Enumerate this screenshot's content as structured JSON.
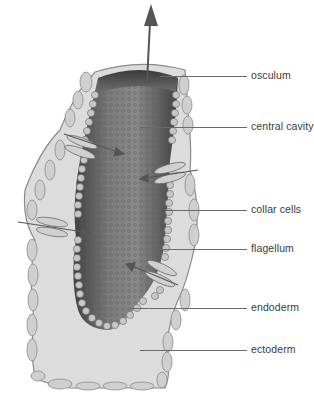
{
  "diagram": {
    "colors": {
      "background": "#ffffff",
      "ectoderm_fill": "#d9d9d9",
      "ectoderm_stroke": "#8a8a8a",
      "mesohyl_fill": "#e4e4e4",
      "cavity_dark": "#4a4a4a",
      "cavity_mid": "#7a7a7a",
      "collar_cell_fill": "#c8c8c8",
      "leader_line": "#6a6a6a",
      "label_text": "#3a3a3a"
    },
    "labels": [
      {
        "id": "osculum",
        "text": "osculum",
        "y": 76
      },
      {
        "id": "central-cavity",
        "text": "central cavity",
        "y": 127
      },
      {
        "id": "collar-cells",
        "text": "collar cells",
        "y": 210
      },
      {
        "id": "flagellum",
        "text": "flagellum",
        "y": 249
      },
      {
        "id": "endoderm",
        "text": "endoderm",
        "y": 308
      },
      {
        "id": "ectoderm",
        "text": "ectoderm",
        "y": 350
      }
    ],
    "arrows": [
      {
        "name": "water-outflow-arrow",
        "direction": "up"
      },
      {
        "name": "water-inflow-arrow",
        "direction": "in"
      }
    ]
  }
}
